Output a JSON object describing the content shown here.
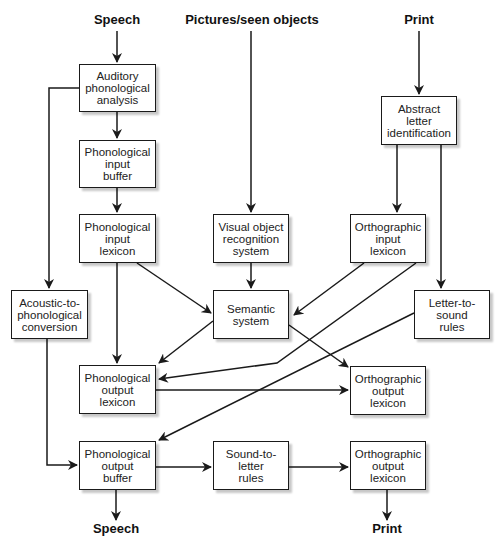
{
  "inputs": {
    "speech": "Speech",
    "pictures": "Pictures/seen objects",
    "print": "Print"
  },
  "outputs": {
    "speech": "Speech",
    "print": "Print"
  },
  "nodes": {
    "auditory_phonological_analysis": "Auditory\nphonological\nanalysis",
    "phonological_input_buffer": "Phonological\ninput\nbuffer",
    "phonological_input_lexicon": "Phonological\ninput\nlexicon",
    "visual_object_recognition_system": "Visual object\nrecognition\nsystem",
    "orthographic_input_lexicon": "Orthographic\ninput\nlexicon",
    "abstract_letter_identification": "Abstract\nletter\nidentification",
    "acoustic_to_phonological_conversion": "Acoustic-to-\nphonological\nconversion",
    "semantic_system": "Semantic\nsystem",
    "letter_to_sound_rules": "Letter-to-\nsound\nrules",
    "phonological_output_lexicon": "Phonological\noutput\nlexicon",
    "orthographic_output_lexicon_1": "Orthographic\noutput\nlexicon",
    "phonological_output_buffer": "Phonological\noutput\nbuffer",
    "sound_to_letter_rules": "Sound-to-\nletter\nrules",
    "orthographic_output_lexicon_2": "Orthographic\noutput\nlexicon"
  },
  "colors": {
    "line": "#1a1a1a",
    "box_border": "#1a1a1a",
    "background": "#ffffff"
  }
}
